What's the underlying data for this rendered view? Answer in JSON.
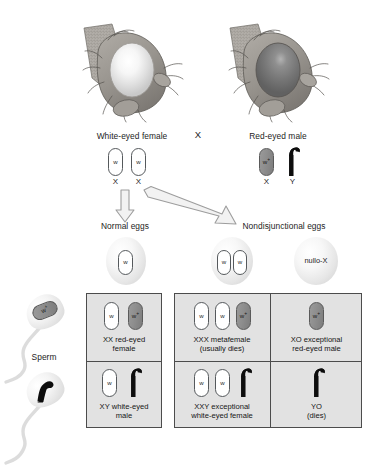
{
  "figure": {
    "cross_symbol": "X"
  },
  "parents": {
    "female": {
      "label": "White-eyed female",
      "eye_color": "#f2f2f2",
      "chromosomes": [
        {
          "allele": "w",
          "type": "X",
          "fill": "white",
          "axis_label": "X"
        },
        {
          "allele": "w",
          "type": "X",
          "fill": "white",
          "axis_label": "X"
        }
      ]
    },
    "male": {
      "label": "Red-eyed male",
      "eye_color": "#7b7b7b",
      "chromosomes": [
        {
          "allele": "w",
          "superscript": "+",
          "type": "X",
          "fill": "gray",
          "axis_label": "X"
        },
        {
          "allele": "",
          "type": "Y",
          "fill": "black",
          "axis_label": "Y"
        }
      ]
    }
  },
  "arrows": {
    "normal": "down-arrow",
    "nondisjunction": "diagonal-arrow"
  },
  "eggs": {
    "normal": {
      "label": "Normal eggs",
      "items": [
        {
          "contents": [
            {
              "allele": "w",
              "fill": "white"
            }
          ]
        }
      ]
    },
    "nondisjunctional": {
      "label": "Nondisjunctional eggs",
      "items": [
        {
          "contents": [
            {
              "allele": "w",
              "fill": "white"
            },
            {
              "allele": "w",
              "fill": "white"
            }
          ]
        },
        {
          "contents": [],
          "text": "nullo-X"
        }
      ]
    }
  },
  "sperm": {
    "label": "Sperm",
    "items": [
      {
        "allele": "w",
        "superscript": "+",
        "fill": "gray",
        "type": "X"
      },
      {
        "allele": "",
        "fill": "black",
        "type": "Y"
      }
    ]
  },
  "offspring": {
    "columns": [
      {
        "group": "normal"
      },
      {
        "group": "nondisjunctional"
      },
      {
        "group": "nondisjunctional"
      }
    ],
    "cells": [
      {
        "id": "xx-red-eyed-female",
        "chromosomes": [
          {
            "allele": "w",
            "fill": "white"
          },
          {
            "allele": "w",
            "superscript": "+",
            "fill": "gray"
          }
        ],
        "line1": "XX red-eyed",
        "line2": "female"
      },
      {
        "id": "xxx-metafemale",
        "chromosomes": [
          {
            "allele": "w",
            "fill": "white"
          },
          {
            "allele": "w",
            "fill": "white"
          },
          {
            "allele": "w",
            "superscript": "+",
            "fill": "gray"
          }
        ],
        "line1": "XXX metafemale",
        "line2": "(usually dies)"
      },
      {
        "id": "xo-exceptional-red-eyed-male",
        "chromosomes": [
          {
            "allele": "w",
            "superscript": "+",
            "fill": "gray"
          }
        ],
        "line1": "XO exceptional",
        "line2": "red-eyed male"
      },
      {
        "id": "xy-white-eyed-male",
        "chromosomes": [
          {
            "allele": "w",
            "fill": "white"
          },
          {
            "allele": "",
            "fill": "black",
            "type": "Y"
          }
        ],
        "line1": "XY white-eyed",
        "line2": "male"
      },
      {
        "id": "xxy-exceptional-white-eyed-female",
        "chromosomes": [
          {
            "allele": "w",
            "fill": "white"
          },
          {
            "allele": "w",
            "fill": "white"
          },
          {
            "allele": "",
            "fill": "black",
            "type": "Y"
          }
        ],
        "line1": "XXY exceptional",
        "line2": "white-eyed female"
      },
      {
        "id": "yo-dies",
        "chromosomes": [
          {
            "allele": "",
            "fill": "black",
            "type": "Y"
          }
        ],
        "line1": "YO",
        "line2": "(dies)"
      }
    ]
  },
  "colors": {
    "box_fill": "#e2e2e2",
    "box_border": "#4c4c4c",
    "chrom_gray": "#8e8e8e",
    "chrom_black": "#101010",
    "arrow_stroke": "#9a9a9a",
    "text": "#1d1d1d"
  }
}
